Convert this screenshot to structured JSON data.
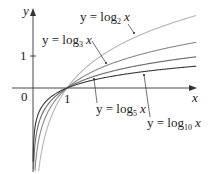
{
  "chart_data": {
    "type": "line",
    "title": "",
    "xlabel": "x",
    "ylabel": "y",
    "x_ticks": [
      "1"
    ],
    "y_ticks": [
      "1"
    ],
    "origin_label": "0",
    "xlim": [
      -0.6,
      4.8
    ],
    "ylim": [
      -2.6,
      2.5
    ],
    "grid": false,
    "series": [
      {
        "name": "y = log2 x",
        "base": 2,
        "color": "#b5b5b5",
        "x": [
          0.05,
          0.1,
          0.25,
          0.5,
          1,
          2,
          3,
          4,
          4.8
        ],
        "values": [
          -4.32,
          -3.32,
          -2.0,
          -1.0,
          0,
          1.0,
          1.58,
          2.0,
          2.26
        ]
      },
      {
        "name": "y = log3 x",
        "base": 3,
        "color": "#8a8a8a",
        "x": [
          0.05,
          0.1,
          0.25,
          0.5,
          1,
          2,
          3,
          4,
          4.8
        ],
        "values": [
          -2.73,
          -2.1,
          -1.26,
          -0.63,
          0,
          0.63,
          1.0,
          1.26,
          1.43
        ]
      },
      {
        "name": "y = log5 x",
        "base": 5,
        "color": "#6a6a6a",
        "x": [
          0.05,
          0.1,
          0.25,
          0.5,
          1,
          2,
          3,
          4,
          4.8
        ],
        "values": [
          -1.86,
          -1.43,
          -0.86,
          -0.43,
          0,
          0.43,
          0.68,
          0.86,
          0.97
        ]
      },
      {
        "name": "y = log10 x",
        "base": 10,
        "color": "#3a3a3a",
        "x": [
          0.05,
          0.1,
          0.25,
          0.5,
          1,
          2,
          3,
          4,
          4.8
        ],
        "values": [
          -1.3,
          -1.0,
          -0.6,
          -0.3,
          0,
          0.3,
          0.48,
          0.6,
          0.68
        ]
      }
    ],
    "annotations": [
      {
        "text_main": "y = log",
        "sub": "2",
        "var": "x",
        "series": "y = log2 x"
      },
      {
        "text_main": "y = log",
        "sub": "3",
        "var": "x",
        "series": "y = log3 x"
      },
      {
        "text_main": "y = log",
        "sub": "5",
        "var": "x",
        "series": "y = log5 x"
      },
      {
        "text_main": "y = log",
        "sub": "10",
        "var": "x",
        "series": "y = log10 x"
      }
    ]
  },
  "layout": {
    "origin_px": [
      33,
      88
    ],
    "unit_x_px": 34,
    "unit_y_px": 32
  }
}
